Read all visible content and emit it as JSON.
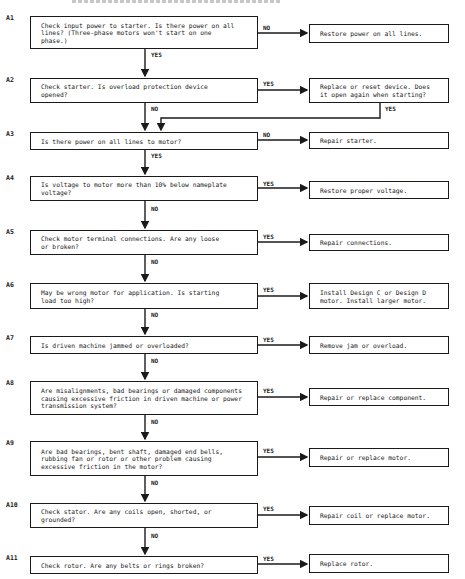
{
  "diagram": {
    "type": "troubleshooting-flowchart",
    "header_clipped": true,
    "steps": [
      {
        "id": "A1",
        "question": "Check input power to starter.  Is there power on all\nlines?  (Three-phase motors won't start on one\nphase.)",
        "branch_label": "NO",
        "action": "Restore power on all lines.",
        "continue_label": "YES"
      },
      {
        "id": "A2",
        "question": "Check starter.  Is overload protection device\nopened?",
        "branch_label": "YES",
        "action": "Replace or reset device.  Does\nit open again when starting?",
        "action_followup_label": "YES",
        "continue_label": "NO"
      },
      {
        "id": "A3",
        "question": "Is there power on all lines to motor?",
        "branch_label": "NO",
        "action": "Repair starter.",
        "continue_label": "YES"
      },
      {
        "id": "A4",
        "question": "Is voltage to motor more than 10% below nameplate\nvoltage?",
        "branch_label": "YES",
        "action": "Restore proper voltage.",
        "continue_label": "NO"
      },
      {
        "id": "A5",
        "question": "Check motor terminal connections.  Are any loose\nor broken?",
        "branch_label": "YES",
        "action": "Repair connections.",
        "continue_label": "NO"
      },
      {
        "id": "A6",
        "question": "May be wrong motor for application.  Is starting\nload too high?",
        "branch_label": "YES",
        "action": "Install Design C or Design D\nmotor.  Install larger motor.",
        "continue_label": "NO"
      },
      {
        "id": "A7",
        "question": "Is driven machine jammed or overloaded?",
        "branch_label": "YES",
        "action": "Remove jam or overload.",
        "continue_label": "NO"
      },
      {
        "id": "A8",
        "question": "Are misalignments, bad bearings or damaged components\ncausing excessive friction in driven machine or power\ntransmission system?",
        "branch_label": "YES",
        "action": "Repair or replace component.",
        "continue_label": "NO"
      },
      {
        "id": "A9",
        "question": "Are bad bearings, bent shaft, damaged end bells,\nrubbing fan or rotor or other problem causing\nexcessive friction in the motor?",
        "branch_label": "YES",
        "action": "Repair or replace motor.",
        "continue_label": "NO"
      },
      {
        "id": "A10",
        "question": "Check stator.  Are any coils open, shorted, or\ngrounded?",
        "branch_label": "YES",
        "action": "Repair coil or replace motor.",
        "continue_label": "NO"
      },
      {
        "id": "A11",
        "question": "Check rotor.  Are any belts or rings broken?",
        "branch_label": "YES",
        "action": "Replace rotor."
      }
    ]
  },
  "colors": {
    "ink": "#1a1a1a",
    "background": "#ffffff"
  }
}
